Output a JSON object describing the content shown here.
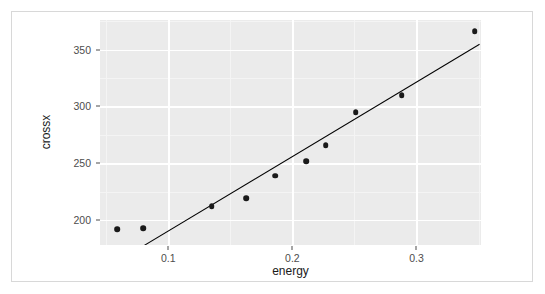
{
  "chart_data": {
    "type": "scatter",
    "title": "",
    "xlabel": "energy",
    "ylabel": "crossx",
    "xlim": [
      0.045,
      0.352
    ],
    "ylim": [
      178,
      376
    ],
    "xticks": [
      0.1,
      0.2,
      0.3
    ],
    "xtick_labels": [
      "0.1",
      "0.2",
      "0.3"
    ],
    "yticks": [
      200,
      250,
      300,
      350
    ],
    "ytick_labels": [
      "200",
      "250",
      "300",
      "350"
    ],
    "xminor": [
      0.05,
      0.15,
      0.25,
      0.35
    ],
    "yminor": [
      175,
      225,
      275,
      325,
      375
    ],
    "grid": true,
    "legend": null,
    "points": [
      {
        "x": 0.059,
        "y": 192
      },
      {
        "x": 0.08,
        "y": 193
      },
      {
        "x": 0.135,
        "y": 212
      },
      {
        "x": 0.163,
        "y": 219
      },
      {
        "x": 0.186,
        "y": 239
      },
      {
        "x": 0.211,
        "y": 252
      },
      {
        "x": 0.227,
        "y": 266
      },
      {
        "x": 0.251,
        "y": 295
      },
      {
        "x": 0.288,
        "y": 310
      },
      {
        "x": 0.347,
        "y": 366
      }
    ],
    "series": [
      {
        "name": "crossx vs energy",
        "type": "scatter",
        "marker": "filled-circle",
        "color": "#1a1a1a",
        "x": [
          0.059,
          0.08,
          0.135,
          0.163,
          0.186,
          0.211,
          0.227,
          0.251,
          0.288,
          0.347
        ],
        "values": [
          192,
          193,
          212,
          219,
          239,
          252,
          266,
          295,
          310,
          366
        ]
      },
      {
        "name": "linear-fit",
        "type": "line",
        "color": "#000000",
        "endpoints": [
          {
            "x": 0.0805,
            "y": 178.3
          },
          {
            "x": 0.351,
            "y": 355.5
          }
        ]
      }
    ],
    "panel_background": "#ebebeb",
    "grid_color": "#ffffff",
    "frame_border_color": "#d8d8d8",
    "point_color": "#1a1a1a",
    "line_color": "#000000",
    "axis_text_color": "#4d4d4d",
    "label_text_color": "#1a1a1a"
  }
}
